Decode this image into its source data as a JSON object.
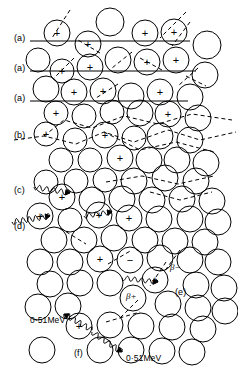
{
  "figure": {
    "background": "#ffffff",
    "ink_color": "#000000",
    "width": 238,
    "height": 372
  },
  "row_labels": [
    {
      "id": "a1",
      "text": "(a)",
      "x": 14,
      "y": 34,
      "track": "solid"
    },
    {
      "id": "a2",
      "text": "(a)",
      "x": 14,
      "y": 64,
      "track": "solid"
    },
    {
      "id": "a3",
      "text": "(a)",
      "x": 14,
      "y": 94,
      "track": "solid"
    },
    {
      "id": "b",
      "text": "(b)",
      "x": 14,
      "y": 131,
      "track": "dashed"
    },
    {
      "id": "c",
      "text": "(c)",
      "x": 14,
      "y": 186,
      "track": "wavy"
    },
    {
      "id": "d",
      "text": "(d)",
      "x": 14,
      "y": 222,
      "track": "wavy"
    },
    {
      "id": "e",
      "text": "(e)",
      "x": 175,
      "y": 288,
      "track": "none"
    },
    {
      "id": "f",
      "text": "(f)",
      "x": 74,
      "y": 349,
      "track": "none"
    }
  ],
  "annotations": [
    {
      "id": "beta-minus",
      "text": "β−",
      "x": 170,
      "y": 263
    },
    {
      "id": "beta-plus",
      "text": "β+",
      "x": 126,
      "y": 292
    },
    {
      "id": "mev-upper",
      "text": "0·51MeV",
      "x": 30,
      "y": 316
    },
    {
      "id": "mev-lower",
      "text": "0·51MeV",
      "x": 126,
      "y": 354
    }
  ],
  "charge_signs": {
    "plus": "+",
    "minus": "−"
  },
  "atoms": [
    {
      "cx": 57,
      "cy": 33,
      "r": 13,
      "charge": "+"
    },
    {
      "cx": 88,
      "cy": 44,
      "r": 13,
      "charge": "+"
    },
    {
      "cx": 110,
      "cy": 22,
      "r": 14,
      "charge": ""
    },
    {
      "cx": 145,
      "cy": 33,
      "r": 13,
      "charge": "+"
    },
    {
      "cx": 174,
      "cy": 32,
      "r": 13,
      "charge": "+"
    },
    {
      "cx": 207,
      "cy": 45,
      "r": 14,
      "charge": ""
    },
    {
      "cx": 38,
      "cy": 60,
      "r": 12,
      "charge": ""
    },
    {
      "cx": 62,
      "cy": 71,
      "r": 12,
      "charge": "+"
    },
    {
      "cx": 90,
      "cy": 67,
      "r": 13,
      "charge": "+"
    },
    {
      "cx": 118,
      "cy": 60,
      "r": 13,
      "charge": ""
    },
    {
      "cx": 147,
      "cy": 62,
      "r": 13,
      "charge": "+"
    },
    {
      "cx": 176,
      "cy": 60,
      "r": 13,
      "charge": "+"
    },
    {
      "cx": 205,
      "cy": 75,
      "r": 13,
      "charge": ""
    },
    {
      "cx": 46,
      "cy": 89,
      "r": 13,
      "charge": ""
    },
    {
      "cx": 74,
      "cy": 92,
      "r": 13,
      "charge": "+"
    },
    {
      "cx": 103,
      "cy": 91,
      "r": 13,
      "charge": "+"
    },
    {
      "cx": 131,
      "cy": 96,
      "r": 13,
      "charge": ""
    },
    {
      "cx": 160,
      "cy": 92,
      "r": 13,
      "charge": "+"
    },
    {
      "cx": 190,
      "cy": 97,
      "r": 13,
      "charge": ""
    },
    {
      "cx": 56,
      "cy": 113,
      "r": 12,
      "charge": "+"
    },
    {
      "cx": 84,
      "cy": 116,
      "r": 12,
      "charge": ""
    },
    {
      "cx": 112,
      "cy": 112,
      "r": 12,
      "charge": ""
    },
    {
      "cx": 140,
      "cy": 113,
      "r": 13,
      "charge": ""
    },
    {
      "cx": 168,
      "cy": 114,
      "r": 13,
      "charge": "+"
    },
    {
      "cx": 198,
      "cy": 118,
      "r": 13,
      "charge": ""
    },
    {
      "cx": 46,
      "cy": 134,
      "r": 12,
      "charge": "+"
    },
    {
      "cx": 75,
      "cy": 140,
      "r": 12,
      "charge": ""
    },
    {
      "cx": 105,
      "cy": 135,
      "r": 13,
      "charge": "+"
    },
    {
      "cx": 134,
      "cy": 138,
      "r": 12,
      "charge": ""
    },
    {
      "cx": 160,
      "cy": 136,
      "r": 13,
      "charge": ""
    },
    {
      "cx": 190,
      "cy": 140,
      "r": 13,
      "charge": ""
    },
    {
      "cx": 61,
      "cy": 160,
      "r": 12,
      "charge": ""
    },
    {
      "cx": 90,
      "cy": 160,
      "r": 12,
      "charge": ""
    },
    {
      "cx": 120,
      "cy": 158,
      "r": 13,
      "charge": "+"
    },
    {
      "cx": 149,
      "cy": 160,
      "r": 13,
      "charge": ""
    },
    {
      "cx": 177,
      "cy": 160,
      "r": 13,
      "charge": ""
    },
    {
      "cx": 206,
      "cy": 163,
      "r": 13,
      "charge": ""
    },
    {
      "cx": 46,
      "cy": 182,
      "r": 12,
      "charge": ""
    },
    {
      "cx": 76,
      "cy": 181,
      "r": 12,
      "charge": ""
    },
    {
      "cx": 105,
      "cy": 180,
      "r": 12,
      "charge": ""
    },
    {
      "cx": 134,
      "cy": 181,
      "r": 13,
      "charge": ""
    },
    {
      "cx": 165,
      "cy": 178,
      "r": 13,
      "charge": ""
    },
    {
      "cx": 196,
      "cy": 181,
      "r": 13,
      "charge": ""
    },
    {
      "cx": 62,
      "cy": 197,
      "r": 13,
      "charge": "+"
    },
    {
      "cx": 92,
      "cy": 200,
      "r": 13,
      "charge": ""
    },
    {
      "cx": 122,
      "cy": 199,
      "r": 13,
      "charge": ""
    },
    {
      "cx": 152,
      "cy": 200,
      "r": 13,
      "charge": ""
    },
    {
      "cx": 182,
      "cy": 199,
      "r": 13,
      "charge": ""
    },
    {
      "cx": 212,
      "cy": 201,
      "r": 13,
      "charge": ""
    },
    {
      "cx": 40,
      "cy": 216,
      "r": 13,
      "charge": "+"
    },
    {
      "cx": 70,
      "cy": 220,
      "r": 12,
      "charge": ""
    },
    {
      "cx": 99,
      "cy": 215,
      "r": 13,
      "charge": "+"
    },
    {
      "cx": 129,
      "cy": 218,
      "r": 13,
      "charge": "+"
    },
    {
      "cx": 159,
      "cy": 219,
      "r": 13,
      "charge": ""
    },
    {
      "cx": 190,
      "cy": 219,
      "r": 13,
      "charge": ""
    },
    {
      "cx": 218,
      "cy": 222,
      "r": 13,
      "charge": ""
    },
    {
      "cx": 54,
      "cy": 240,
      "r": 13,
      "charge": ""
    },
    {
      "cx": 84,
      "cy": 240,
      "r": 13,
      "charge": ""
    },
    {
      "cx": 114,
      "cy": 238,
      "r": 13,
      "charge": ""
    },
    {
      "cx": 145,
      "cy": 240,
      "r": 13,
      "charge": ""
    },
    {
      "cx": 175,
      "cy": 241,
      "r": 13,
      "charge": ""
    },
    {
      "cx": 205,
      "cy": 242,
      "r": 13,
      "charge": ""
    },
    {
      "cx": 40,
      "cy": 262,
      "r": 13,
      "charge": ""
    },
    {
      "cx": 70,
      "cy": 262,
      "r": 13,
      "charge": ""
    },
    {
      "cx": 100,
      "cy": 259,
      "r": 13,
      "charge": "+"
    },
    {
      "cx": 130,
      "cy": 260,
      "r": 13,
      "charge": "−"
    },
    {
      "cx": 160,
      "cy": 258,
      "r": 13,
      "charge": ""
    },
    {
      "cx": 190,
      "cy": 260,
      "r": 13,
      "charge": ""
    },
    {
      "cx": 218,
      "cy": 262,
      "r": 13,
      "charge": ""
    },
    {
      "cx": 50,
      "cy": 284,
      "r": 13,
      "charge": ""
    },
    {
      "cx": 80,
      "cy": 283,
      "r": 13,
      "charge": ""
    },
    {
      "cx": 110,
      "cy": 283,
      "r": 13,
      "charge": ""
    },
    {
      "cx": 155,
      "cy": 280,
      "r": 13,
      "charge": "+"
    },
    {
      "cx": 196,
      "cy": 285,
      "r": 13,
      "charge": ""
    },
    {
      "cx": 224,
      "cy": 288,
      "r": 13,
      "charge": ""
    },
    {
      "cx": 38,
      "cy": 307,
      "r": 13,
      "charge": ""
    },
    {
      "cx": 68,
      "cy": 306,
      "r": 13,
      "charge": ""
    },
    {
      "cx": 133,
      "cy": 298,
      "r": 13,
      "charge": ""
    },
    {
      "cx": 168,
      "cy": 304,
      "r": 13,
      "charge": ""
    },
    {
      "cx": 198,
      "cy": 308,
      "r": 13,
      "charge": ""
    },
    {
      "cx": 225,
      "cy": 311,
      "r": 13,
      "charge": ""
    },
    {
      "cx": 79,
      "cy": 326,
      "r": 13,
      "charge": "+"
    },
    {
      "cx": 110,
      "cy": 325,
      "r": 13,
      "charge": ""
    },
    {
      "cx": 141,
      "cy": 326,
      "r": 13,
      "charge": ""
    },
    {
      "cx": 172,
      "cy": 327,
      "r": 13,
      "charge": ""
    },
    {
      "cx": 203,
      "cy": 329,
      "r": 13,
      "charge": ""
    },
    {
      "cx": 42,
      "cy": 350,
      "r": 13,
      "charge": ""
    },
    {
      "cx": 100,
      "cy": 350,
      "r": 13,
      "charge": ""
    },
    {
      "cx": 131,
      "cy": 350,
      "r": 13,
      "charge": ""
    },
    {
      "cx": 162,
      "cy": 351,
      "r": 13,
      "charge": ""
    },
    {
      "cx": 192,
      "cy": 352,
      "r": 13,
      "charge": ""
    }
  ],
  "tracks": {
    "solid_lines": [
      {
        "id": "a1-track",
        "x1": 30,
        "y1": 41,
        "x2": 190,
        "y2": 41
      },
      {
        "id": "a2-track",
        "x1": 30,
        "y1": 71,
        "x2": 196,
        "y2": 71
      },
      {
        "id": "a3-track",
        "x1": 30,
        "y1": 101,
        "x2": 188,
        "y2": 101
      }
    ],
    "dashed_strokes": [
      {
        "id": "delta-ray-1",
        "d": "M70 10 L52 38"
      },
      {
        "id": "delta-ray-2",
        "d": "M100 53 L78 40"
      },
      {
        "id": "delta-ray-3",
        "d": "M186 12 L160 38"
      },
      {
        "id": "delta-ray-4",
        "d": "M190 22 L172 46"
      },
      {
        "id": "delta-ray-5",
        "d": "M74 58 L54 78"
      },
      {
        "id": "delta-ray-6",
        "d": "M132 52 L112 68"
      },
      {
        "id": "delta-ray-7",
        "d": "M162 70 L140 58"
      },
      {
        "id": "delta-ray-8",
        "d": "M198 68 L178 86"
      },
      {
        "id": "delta-ray-9",
        "d": "M118 84 L96 98"
      },
      {
        "id": "delta-ray-10",
        "d": "M186 76 L206 86"
      },
      {
        "id": "b-track",
        "d": "M14 140 L44 136 L76 144 L104 132 L134 142 L168 130 L200 140 L236 132"
      },
      {
        "id": "b-branch-1",
        "d": "M44 136 L64 120 L92 128 L124 116 L158 124 L192 114 L232 120"
      },
      {
        "id": "b-branch-2",
        "d": "M104 132 L140 150 L176 142 L214 152"
      },
      {
        "id": "c-track",
        "d": "M106 182 L142 176 L178 184 L214 176"
      },
      {
        "id": "c-branch",
        "d": "M150 192 L180 200 L212 192"
      },
      {
        "id": "scatter-1",
        "d": "M60 228 L86 244"
      },
      {
        "id": "scatter-2",
        "d": "M108 264 L132 250"
      },
      {
        "id": "e-track",
        "d": "M166 262 L150 286"
      },
      {
        "id": "beta-plus-track",
        "d": "M138 300 L120 318"
      },
      {
        "id": "pair-track",
        "d": "M106 322 L140 312"
      },
      {
        "id": "beta-minus-track",
        "d": "M180 250 L164 272"
      }
    ],
    "wavy_photons": [
      {
        "id": "c-photon",
        "x1": 34,
        "y1": 187,
        "x2": 70,
        "y2": 193,
        "amp": 2.6,
        "cycles": 5,
        "arrow": true
      },
      {
        "id": "d-photon",
        "x1": 12,
        "y1": 222,
        "x2": 50,
        "y2": 216,
        "amp": 2.8,
        "cycles": 6,
        "arrow": true
      },
      {
        "id": "d-photon-2",
        "x1": 84,
        "y1": 216,
        "x2": 112,
        "y2": 212,
        "amp": 2.4,
        "cycles": 4,
        "arrow": true
      },
      {
        "id": "e-photon",
        "x1": 122,
        "y1": 278,
        "x2": 158,
        "y2": 282,
        "amp": 2.4,
        "cycles": 5,
        "arrow": true
      },
      {
        "id": "f-photon-up",
        "x1": 92,
        "y1": 330,
        "x2": 64,
        "y2": 314,
        "amp": 2.6,
        "cycles": 5,
        "arrow": true
      },
      {
        "id": "f-photon-down",
        "x1": 92,
        "y1": 332,
        "x2": 122,
        "y2": 352,
        "amp": 2.6,
        "cycles": 5,
        "arrow": true
      }
    ]
  }
}
